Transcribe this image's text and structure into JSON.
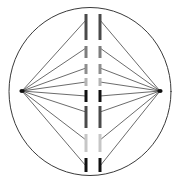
{
  "figure": {
    "background_color": "#ffffff",
    "width": 180,
    "height": 182
  },
  "cell_membrane": {
    "name": "cell-membrane",
    "shape": "ellipse",
    "cx": 90,
    "cy": 91.5,
    "rx": 81,
    "ry": 84,
    "stroke_color": "#3a3a3a",
    "stroke_width": 1,
    "fill": "none"
  },
  "poles": [
    {
      "name": "left-spindle-pole",
      "label": "Left centrosome",
      "x": 22,
      "y": 91,
      "color": "#111111"
    },
    {
      "name": "right-spindle-pole",
      "label": "Right centrosome",
      "x": 160,
      "y": 91,
      "color": "#111111"
    }
  ],
  "spindle_fibers": {
    "name": "spindle-fibers",
    "label": "Spindle microtubules",
    "stroke_color": "#2b2b2b",
    "stroke_width": 0.7,
    "left_targets_x": 86,
    "right_targets_x": 100,
    "target_y_values": [
      20,
      48,
      68,
      82,
      96,
      112,
      140,
      166
    ]
  },
  "chromosomes": {
    "name": "metaphase-plate-chromosomes",
    "label": "Chromatids at metaphase plate",
    "left_column_x": 86,
    "right_column_x": 100,
    "segment_width": 3,
    "left_segments": [
      {
        "y_top": 14,
        "y_bottom": 40,
        "color": "#4a4a4a"
      },
      {
        "y_top": 46,
        "y_bottom": 58,
        "color": "#7d7d7d"
      },
      {
        "y_top": 64,
        "y_bottom": 74,
        "color": "#8e8e8e"
      },
      {
        "y_top": 78,
        "y_bottom": 86,
        "color": "#b4b4b4"
      },
      {
        "y_top": 90,
        "y_bottom": 102,
        "color": "#111111"
      },
      {
        "y_top": 106,
        "y_bottom": 128,
        "color": "#4a4a4a"
      },
      {
        "y_top": 134,
        "y_bottom": 152,
        "color": "#c6c6c6"
      },
      {
        "y_top": 158,
        "y_bottom": 172,
        "color": "#111111"
      }
    ],
    "right_segments": [
      {
        "y_top": 14,
        "y_bottom": 40,
        "color": "#4a4a4a"
      },
      {
        "y_top": 46,
        "y_bottom": 58,
        "color": "#7d7d7d"
      },
      {
        "y_top": 64,
        "y_bottom": 74,
        "color": "#8e8e8e"
      },
      {
        "y_top": 78,
        "y_bottom": 86,
        "color": "#b4b4b4"
      },
      {
        "y_top": 90,
        "y_bottom": 102,
        "color": "#111111"
      },
      {
        "y_top": 106,
        "y_bottom": 128,
        "color": "#4a4a4a"
      },
      {
        "y_top": 134,
        "y_bottom": 152,
        "color": "#c6c6c6"
      },
      {
        "y_top": 158,
        "y_bottom": 172,
        "color": "#111111"
      }
    ]
  }
}
